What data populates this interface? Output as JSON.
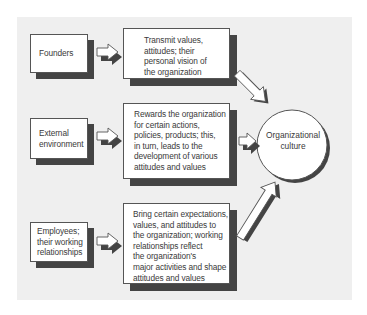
{
  "diagram": {
    "title": "",
    "colors": {
      "panel_background": "#efefef",
      "box_fill": "#ffffff",
      "box_border": "#555555",
      "shadow": "#444444",
      "text": "#3a3a3a"
    },
    "sources": [
      {
        "id": "founders",
        "lines": [
          "Founders"
        ]
      },
      {
        "id": "external-environment",
        "lines": [
          "External",
          "environment"
        ]
      },
      {
        "id": "employees",
        "lines": [
          "Employees;",
          "their working",
          "relationships"
        ]
      }
    ],
    "descriptions": [
      {
        "id": "founders-desc",
        "lines": [
          "Transmit values,",
          "attitudes; their",
          "personal vision of",
          "the organization"
        ]
      },
      {
        "id": "external-desc",
        "lines": [
          "Rewards the organization",
          "for certain actions,",
          "policies, products; this,",
          "in turn, leads to the",
          "development of various",
          "attitudes and values"
        ]
      },
      {
        "id": "employees-desc",
        "lines": [
          "Bring certain expectations,",
          "values, and attitudes to",
          "the organization; working",
          "relationships reflect",
          "the organization's",
          "major activities and shape",
          "attitudes and values"
        ]
      }
    ],
    "target": {
      "id": "organizational-culture",
      "lines": [
        "Organizational",
        "culture"
      ]
    },
    "edges": [
      {
        "from": "founders",
        "to": "founders-desc"
      },
      {
        "from": "external-environment",
        "to": "external-desc"
      },
      {
        "from": "employees",
        "to": "employees-desc"
      },
      {
        "from": "founders-desc",
        "to": "organizational-culture"
      },
      {
        "from": "external-desc",
        "to": "organizational-culture"
      },
      {
        "from": "employees-desc",
        "to": "organizational-culture"
      }
    ]
  }
}
